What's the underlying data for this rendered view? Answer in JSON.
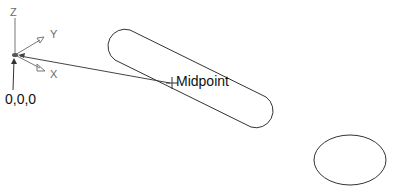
{
  "axes": {
    "z_label": "Z",
    "y_label": "Y",
    "x_label": "X"
  },
  "labels": {
    "origin": "0,0,0",
    "midpoint": "Midpoint"
  },
  "colors": {
    "stroke": "#333333",
    "axis": "#777777",
    "background": "#ffffff"
  }
}
